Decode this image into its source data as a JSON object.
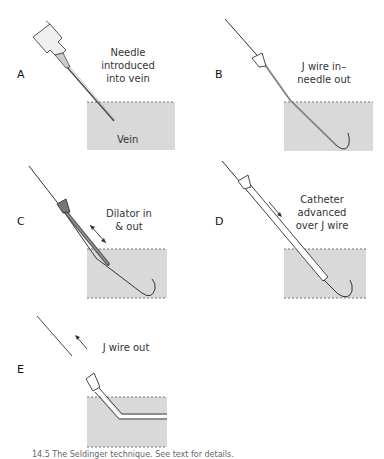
{
  "figure": {
    "panels": [
      {
        "id": "A",
        "label": "A",
        "caption_lines": [
          "Needle",
          "introduced",
          "into vein"
        ],
        "vein_label": "Vein"
      },
      {
        "id": "B",
        "label": "B",
        "caption_lines": [
          "J wire in–",
          "needle out"
        ]
      },
      {
        "id": "C",
        "label": "C",
        "caption_lines": [
          "Dilator in",
          "& out"
        ]
      },
      {
        "id": "D",
        "label": "D",
        "caption_lines": [
          "Catheter",
          "advanced",
          "over J wire"
        ]
      },
      {
        "id": "E",
        "label": "E",
        "caption_lines": [
          "J wire out"
        ]
      }
    ],
    "caption": "14.5 The Seldinger technique. See text for details.",
    "colors": {
      "vein_fill": "#d9d9d9",
      "vein_border": "#777777",
      "line": "#333333",
      "hub_fill": "#e6e6e6",
      "dilator_fill": "#8a8a8a"
    }
  }
}
